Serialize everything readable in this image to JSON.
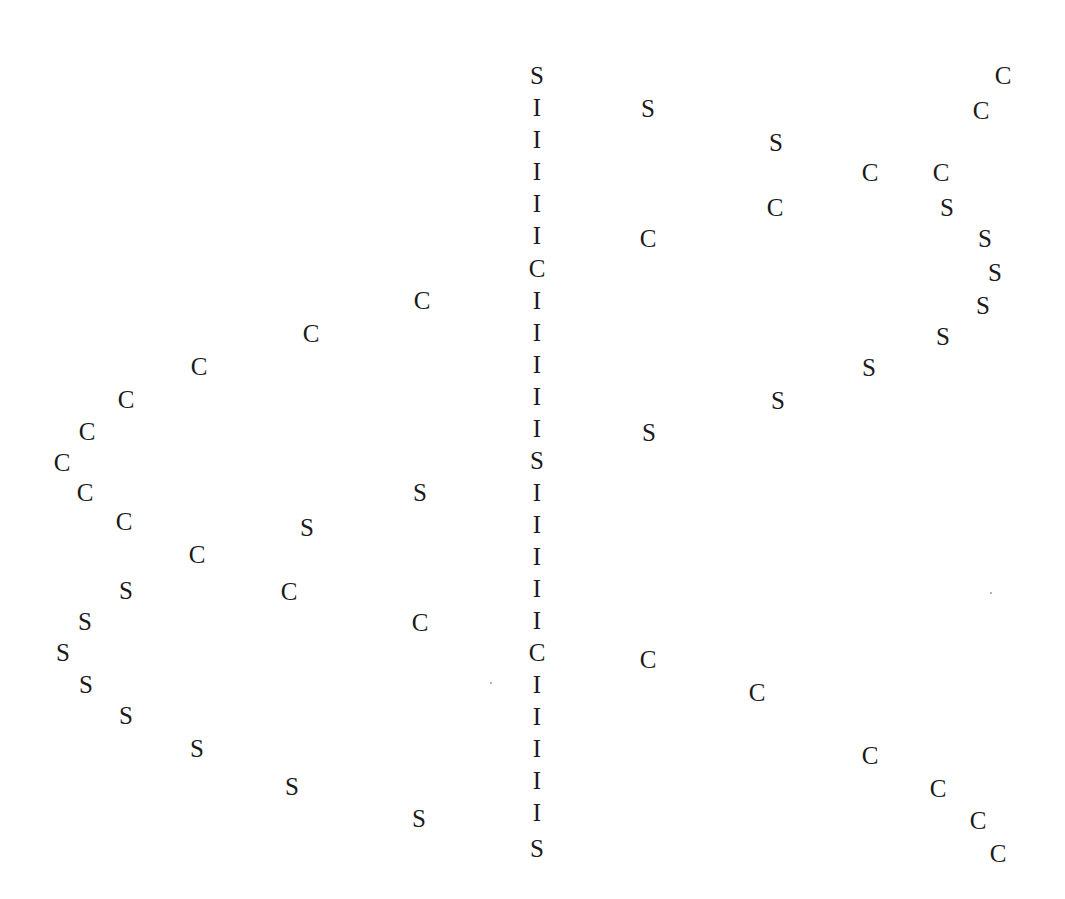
{
  "chart_data": {
    "type": "scatter",
    "title": "",
    "subtitle": "",
    "xlabel": "",
    "ylabel": "",
    "axes_visible": false,
    "grid": false,
    "legend": null,
    "tick_labels": [],
    "annotations": [],
    "background_color": "#ffffff",
    "marker_color": "#1a1a1a",
    "symbol_classes": [
      "S",
      "C",
      "I"
    ],
    "symbol_counts": {
      "S": 30,
      "C": 32,
      "I": 22
    },
    "xlim": [
      0,
      1065
    ],
    "ylim": [
      0,
      899
    ],
    "note": "Scatter of categorical letter glyphs forming a lens/eye shaped pattern: a vertical I spine at center with C and S arcs mirrored left and right.",
    "series": [
      {
        "name": "center-spine",
        "symbol_sequence": "S I I I I I C I I I I I S I I I I I C I I I I I S",
        "points": [
          {
            "symbol": "S",
            "x": 537,
            "y": 75
          },
          {
            "symbol": "I",
            "x": 537,
            "y": 107
          },
          {
            "symbol": "I",
            "x": 537,
            "y": 139
          },
          {
            "symbol": "I",
            "x": 537,
            "y": 171
          },
          {
            "symbol": "I",
            "x": 537,
            "y": 203
          },
          {
            "symbol": "I",
            "x": 537,
            "y": 235
          },
          {
            "symbol": "C",
            "x": 537,
            "y": 268
          },
          {
            "symbol": "I",
            "x": 537,
            "y": 300
          },
          {
            "symbol": "I",
            "x": 537,
            "y": 332
          },
          {
            "symbol": "I",
            "x": 537,
            "y": 364
          },
          {
            "symbol": "I",
            "x": 537,
            "y": 396
          },
          {
            "symbol": "I",
            "x": 537,
            "y": 428
          },
          {
            "symbol": "S",
            "x": 537,
            "y": 460
          },
          {
            "symbol": "I",
            "x": 537,
            "y": 492
          },
          {
            "symbol": "I",
            "x": 537,
            "y": 524
          },
          {
            "symbol": "I",
            "x": 537,
            "y": 556
          },
          {
            "symbol": "I",
            "x": 537,
            "y": 588
          },
          {
            "symbol": "I",
            "x": 537,
            "y": 620
          },
          {
            "symbol": "C",
            "x": 537,
            "y": 652
          },
          {
            "symbol": "I",
            "x": 537,
            "y": 684
          },
          {
            "symbol": "I",
            "x": 537,
            "y": 716
          },
          {
            "symbol": "I",
            "x": 537,
            "y": 748
          },
          {
            "symbol": "I",
            "x": 537,
            "y": 780
          },
          {
            "symbol": "I",
            "x": 537,
            "y": 812
          },
          {
            "symbol": "S",
            "x": 537,
            "y": 848
          }
        ]
      },
      {
        "name": "left-upper-C-arc",
        "points": [
          {
            "symbol": "C",
            "x": 422,
            "y": 300
          },
          {
            "symbol": "C",
            "x": 311,
            "y": 333
          },
          {
            "symbol": "C",
            "x": 199,
            "y": 366
          },
          {
            "symbol": "C",
            "x": 126,
            "y": 399
          },
          {
            "symbol": "C",
            "x": 87,
            "y": 431
          },
          {
            "symbol": "C",
            "x": 62,
            "y": 462
          },
          {
            "symbol": "C",
            "x": 85,
            "y": 492
          }
        ]
      },
      {
        "name": "left-lower-C-arc",
        "points": [
          {
            "symbol": "C",
            "x": 124,
            "y": 521
          },
          {
            "symbol": "C",
            "x": 197,
            "y": 554
          },
          {
            "symbol": "C",
            "x": 289,
            "y": 591
          },
          {
            "symbol": "C",
            "x": 420,
            "y": 622
          }
        ]
      },
      {
        "name": "left-upper-S-arc",
        "points": [
          {
            "symbol": "S",
            "x": 420,
            "y": 492
          },
          {
            "symbol": "S",
            "x": 307,
            "y": 527
          },
          {
            "symbol": "S",
            "x": 126,
            "y": 590
          },
          {
            "symbol": "S",
            "x": 85,
            "y": 621
          },
          {
            "symbol": "S",
            "x": 63,
            "y": 652
          },
          {
            "symbol": "S",
            "x": 86,
            "y": 684
          }
        ]
      },
      {
        "name": "left-lower-S-arc",
        "points": [
          {
            "symbol": "S",
            "x": 126,
            "y": 715
          },
          {
            "symbol": "S",
            "x": 197,
            "y": 748
          },
          {
            "symbol": "S",
            "x": 292,
            "y": 786
          },
          {
            "symbol": "S",
            "x": 419,
            "y": 818
          }
        ]
      },
      {
        "name": "right-upper-S-arc",
        "points": [
          {
            "symbol": "S",
            "x": 648,
            "y": 108
          },
          {
            "symbol": "S",
            "x": 776,
            "y": 142
          },
          {
            "symbol": "S",
            "x": 947,
            "y": 207
          },
          {
            "symbol": "S",
            "x": 985,
            "y": 238
          },
          {
            "symbol": "S",
            "x": 995,
            "y": 272
          },
          {
            "symbol": "S",
            "x": 983,
            "y": 305
          },
          {
            "symbol": "S",
            "x": 943,
            "y": 336
          }
        ]
      },
      {
        "name": "right-inner-S-arc",
        "points": [
          {
            "symbol": "S",
            "x": 869,
            "y": 367
          },
          {
            "symbol": "S",
            "x": 778,
            "y": 400
          },
          {
            "symbol": "S",
            "x": 649,
            "y": 432
          }
        ]
      },
      {
        "name": "right-upper-C-arc",
        "points": [
          {
            "symbol": "C",
            "x": 1003,
            "y": 75
          },
          {
            "symbol": "C",
            "x": 981,
            "y": 110
          },
          {
            "symbol": "C",
            "x": 941,
            "y": 172
          },
          {
            "symbol": "C",
            "x": 870,
            "y": 172
          },
          {
            "symbol": "C",
            "x": 775,
            "y": 207
          },
          {
            "symbol": "C",
            "x": 648,
            "y": 238
          }
        ]
      },
      {
        "name": "right-lower-C-arc",
        "points": [
          {
            "symbol": "C",
            "x": 648,
            "y": 659
          },
          {
            "symbol": "C",
            "x": 757,
            "y": 692
          },
          {
            "symbol": "C",
            "x": 870,
            "y": 755
          },
          {
            "symbol": "C",
            "x": 938,
            "y": 788
          },
          {
            "symbol": "C",
            "x": 978,
            "y": 820
          },
          {
            "symbol": "C",
            "x": 998,
            "y": 853
          }
        ]
      }
    ]
  },
  "figure": {
    "width": 1065,
    "height": 899,
    "background": "#ffffff"
  },
  "specks": [
    {
      "x": 490,
      "y": 682
    },
    {
      "x": 990,
      "y": 592
    }
  ]
}
